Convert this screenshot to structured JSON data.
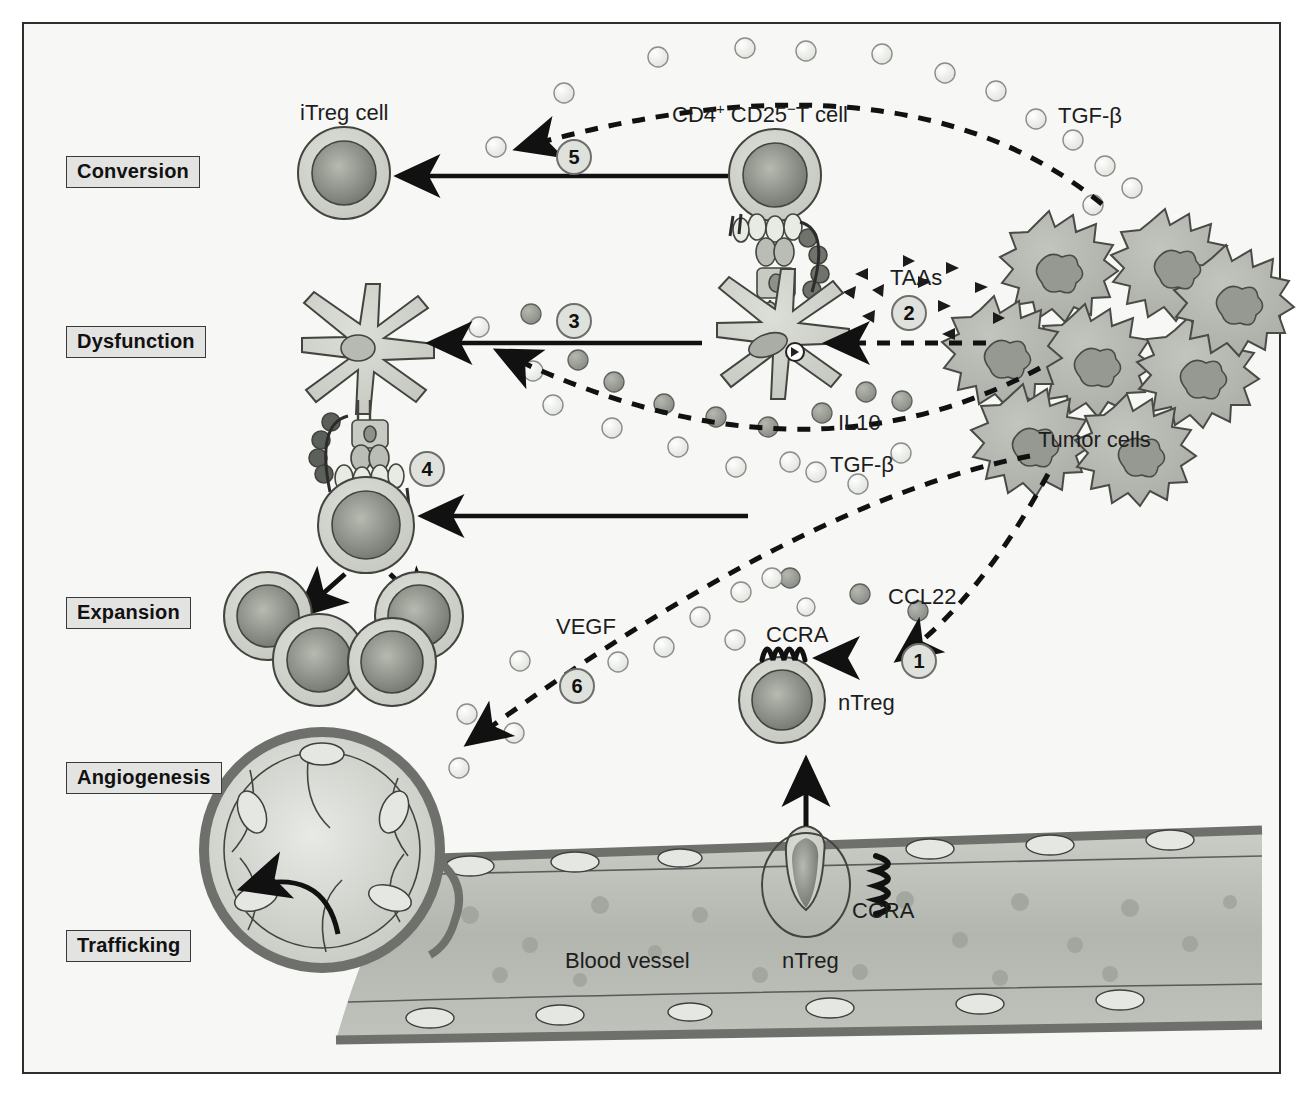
{
  "figure": {
    "background_color": "#f7f7f6",
    "border_color": "#2e2e2e"
  },
  "stages": [
    {
      "id": "conversion",
      "label": "Conversion",
      "x": 66,
      "y": 156
    },
    {
      "id": "dysfunction",
      "label": "Dysfunction",
      "x": 66,
      "y": 326
    },
    {
      "id": "expansion",
      "label": "Expansion",
      "x": 66,
      "y": 597
    },
    {
      "id": "angiogenesis",
      "label": "Angiogenesis",
      "x": 66,
      "y": 762
    },
    {
      "id": "trafficking",
      "label": "Trafficking",
      "x": 66,
      "y": 930
    }
  ],
  "cell_labels": [
    {
      "id": "itreg-cell",
      "text": "iTreg cell",
      "x": 300,
      "y": 100
    },
    {
      "id": "cd4-t-cell",
      "text": "CD4+ CD25−T cell",
      "x": 672,
      "y": 100,
      "rich": true
    },
    {
      "id": "tumor-cells",
      "text": "Tumor cells",
      "x": 1038,
      "y": 427
    },
    {
      "id": "ntreg-tissue",
      "text": "nTreg",
      "x": 838,
      "y": 690
    },
    {
      "id": "ntreg-vessel",
      "text": "nTreg",
      "x": 782,
      "y": 948
    },
    {
      "id": "blood-vessel",
      "text": "Blood vessel",
      "x": 565,
      "y": 948
    }
  ],
  "molecule_labels": [
    {
      "id": "tgfb-top",
      "text": "TGF-β",
      "x": 1058,
      "y": 103,
      "species": "TGF-beta"
    },
    {
      "id": "taas",
      "text": "TAAs",
      "x": 890,
      "y": 265,
      "species": "TAA"
    },
    {
      "id": "il10",
      "text": "IL10",
      "x": 838,
      "y": 410,
      "species": "IL10"
    },
    {
      "id": "tgfb-mid",
      "text": "TGF-β",
      "x": 830,
      "y": 452,
      "species": "TGF-beta"
    },
    {
      "id": "ccl22",
      "text": "CCL22",
      "x": 888,
      "y": 584,
      "species": "CCL22"
    },
    {
      "id": "vegf",
      "text": "VEGF",
      "x": 556,
      "y": 614,
      "species": "VEGF"
    }
  ],
  "receptor_labels": [
    {
      "id": "ccra-tissue",
      "text": "CCRA",
      "x": 766,
      "y": 622
    },
    {
      "id": "ccra-vessel",
      "text": "CCRA",
      "x": 852,
      "y": 898
    }
  ],
  "step_markers": [
    {
      "id": "step-1",
      "number": "1",
      "cx": 919,
      "cy": 661,
      "r": 17
    },
    {
      "id": "step-2",
      "number": "2",
      "cx": 909,
      "cy": 313,
      "r": 17
    },
    {
      "id": "step-3",
      "number": "3",
      "cx": 574,
      "cy": 321,
      "r": 17
    },
    {
      "id": "step-4",
      "number": "4",
      "cx": 427,
      "cy": 469,
      "r": 17
    },
    {
      "id": "step-5",
      "number": "5",
      "cx": 574,
      "cy": 157,
      "r": 17
    },
    {
      "id": "step-6",
      "number": "6",
      "cx": 577,
      "cy": 686,
      "r": 17
    }
  ],
  "colors": {
    "cell_membrane": "#c9cdc4",
    "cell_nucleus": "#7e8279",
    "tumor_fill": "#b4b8b0",
    "tumor_nucleus": "#8d918a",
    "vessel_wall": "#7a7d76",
    "vessel_lumen": "#b8bcb4",
    "tgfb_particle": "#eceeea",
    "il10_particle": "#9a9e96",
    "vegf_particle": "#c4c8c0",
    "line": "#111111",
    "label_bg": "#e3e3e1"
  },
  "legend_semantics": {
    "step_1": "nTreg recruitment via CCL22 / CCRA chemokine gradient",
    "step_2": "Tumor associated antigens released to dendritic cell",
    "step_3": "Dendritic cell dysfunction caused by IL10 and TGF-beta",
    "step_4": "Treg expansion after antigen presentation",
    "step_5": "Conversion of CD4+ CD25- T cell to iTreg by TGF-beta",
    "step_6": "VEGF driven angiogenesis"
  }
}
